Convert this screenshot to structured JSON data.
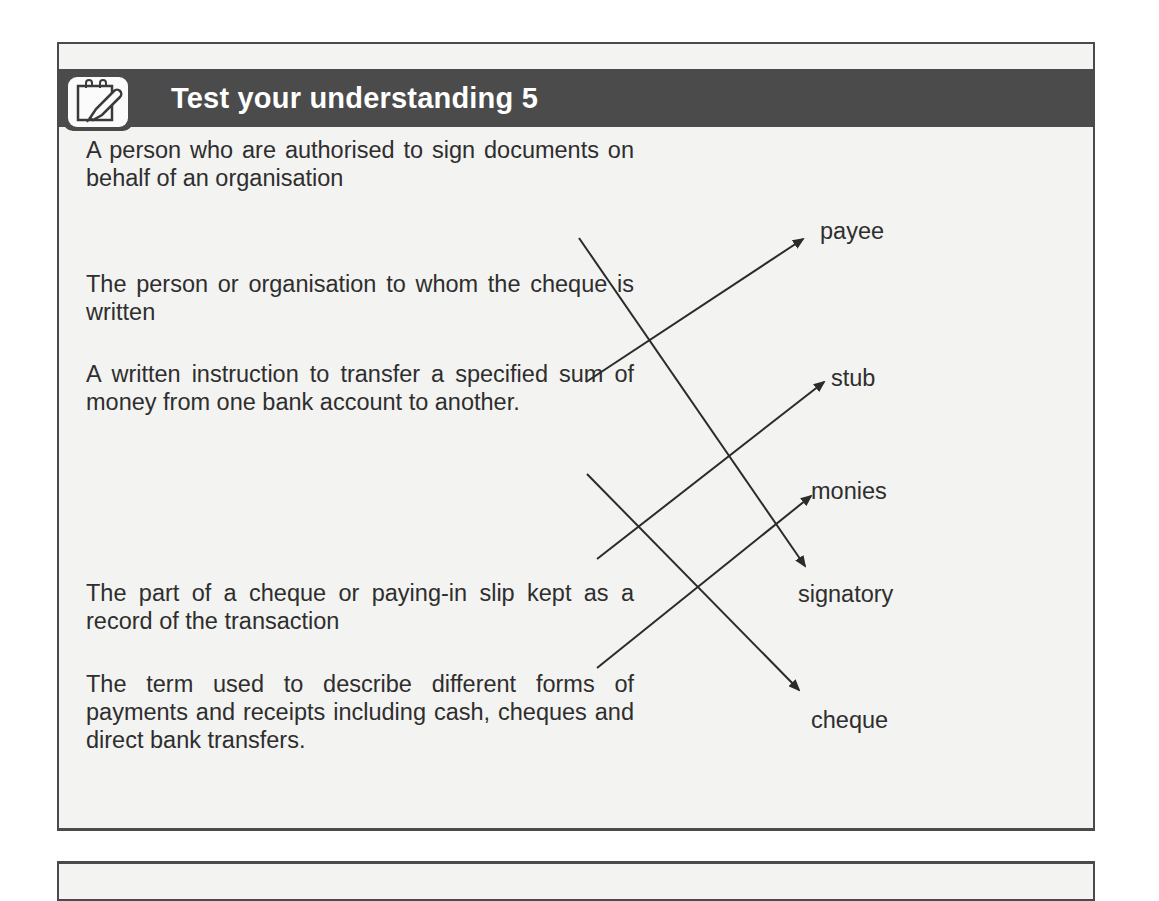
{
  "header": {
    "title": "Test your understanding 5",
    "icon": "notepad-pencil-icon"
  },
  "descriptions": [
    "A person who are authorised to sign documents on behalf of an organisation",
    "The person or organisation to whom the cheque is written",
    "A written instruction to transfer a specified sum of money from one bank account to another.",
    "The part of a cheque or paying-in slip kept as a record of the transaction",
    "The term used to describe different forms of payments and receipts including cash, cheques and direct bank transfers."
  ],
  "terms": [
    "payee",
    "stub",
    "monies",
    "signatory",
    "cheque"
  ],
  "matches": [
    {
      "description": 1,
      "term": "signatory"
    },
    {
      "description": 2,
      "term": "payee"
    },
    {
      "description": 3,
      "term": "cheque"
    },
    {
      "description": 4,
      "term": "stub"
    },
    {
      "description": 5,
      "term": "monies"
    }
  ],
  "colors": {
    "header_bg": "#4b4b4b",
    "header_text": "#ffffff",
    "panel_bg": "#f3f3f1",
    "border": "#4a4a4a",
    "text": "#2e2e2e"
  }
}
